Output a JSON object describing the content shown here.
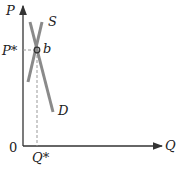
{
  "diagram": {
    "axes": {
      "y_label": "P",
      "x_label": "Q",
      "origin_label": "0"
    },
    "curves": [
      {
        "name": "supply",
        "label": "S"
      },
      {
        "name": "demand",
        "label": "D"
      }
    ],
    "equilibrium": {
      "point_label": "b",
      "price_label": "P*",
      "quantity_label": "Q*"
    },
    "colors": {
      "axis": "#333333",
      "curve": "#8a8a8a",
      "dashed": "#999999"
    }
  }
}
